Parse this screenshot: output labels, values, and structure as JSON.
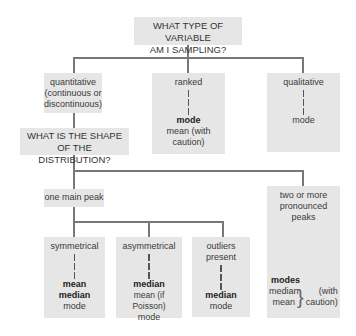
{
  "root": {
    "line1": "WHAT TYPE OF VARIABLE",
    "line2": "AM I SAMPLING?"
  },
  "quantitative": {
    "line1": "quantitative",
    "line2": "(continuous or",
    "line3": "discontinuous)"
  },
  "ranked": {
    "label": "ranked",
    "primary": "mode",
    "secondary1": "mean (with",
    "secondary2": "caution)"
  },
  "qualitative": {
    "label": "qualitative",
    "primary": "mode"
  },
  "shape_question": {
    "line1": "WHAT IS THE SHAPE",
    "line2": "OF THE DISTRIBUTION?"
  },
  "one_peak": {
    "label": "one main peak"
  },
  "multi_peak": {
    "line1": "two or more",
    "line2": "pronounced peaks",
    "primary": "modes",
    "item1": "median",
    "item2": "mean",
    "note1": "(with",
    "note2": "caution)"
  },
  "symmetrical": {
    "label": "symmetrical",
    "primary1": "mean",
    "primary2": "median",
    "secondary": "mode"
  },
  "asymmetrical": {
    "label": "asymmetrical",
    "primary": "median",
    "secondary1": "mean (if Poisson)",
    "secondary2": "mode"
  },
  "outliers": {
    "line1": "outliers",
    "line2": "present",
    "primary": "median",
    "secondary": "mode"
  }
}
